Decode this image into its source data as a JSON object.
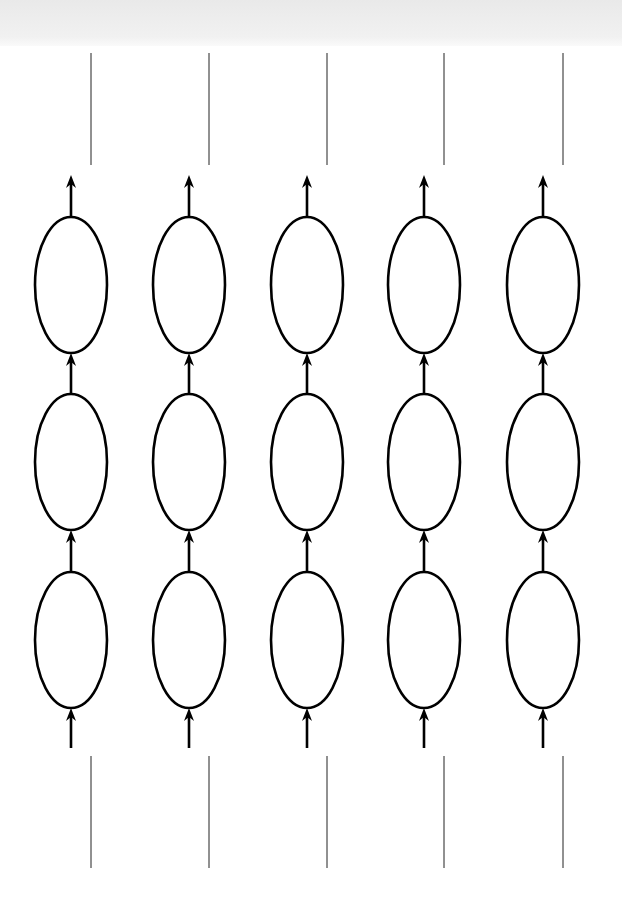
{
  "diagram": {
    "type": "unrolled-chain-grid",
    "columns": 5,
    "rows": 3,
    "column_centers_x": [
      71,
      189,
      307,
      424,
      543
    ],
    "row_centers_y": [
      285,
      462,
      640
    ],
    "ellipse": {
      "rx": 36,
      "ry": 68
    },
    "separator_lines_x": [
      91,
      209,
      327,
      444,
      563
    ],
    "top_separators": {
      "y1": 53,
      "y2": 165
    },
    "bottom_separators": {
      "y1": 756,
      "y2": 868
    },
    "input_arrows": {
      "from_y": 748,
      "to_y": 708
    },
    "output_arrows": {
      "from_y": 216,
      "to_y": 175
    },
    "stroke_color": "#000000",
    "background_color": "#ffffff",
    "top_band_color": "#ececec"
  },
  "labels": []
}
